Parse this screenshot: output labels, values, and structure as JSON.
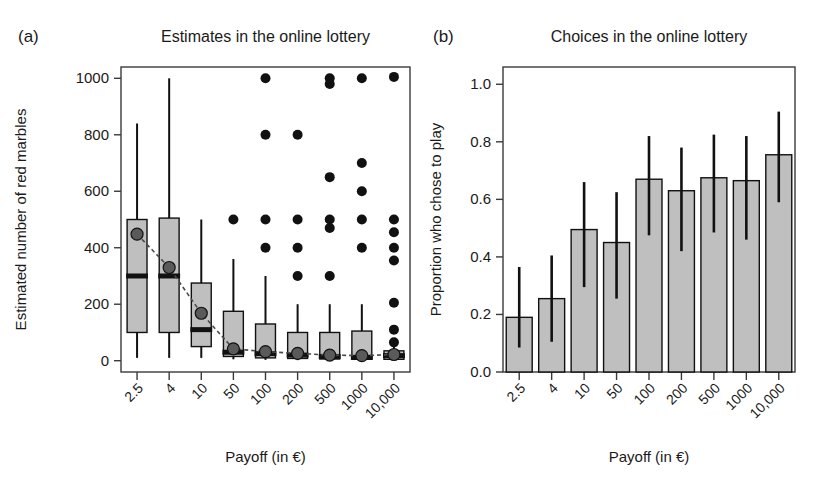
{
  "figure": {
    "width": 830,
    "height": 482,
    "background": "#ffffff",
    "ink_color": "#1a1a1a",
    "fill_gray": "#bfbfbf",
    "mean_gray": "#5a5a5a"
  },
  "panels": [
    {
      "letter": "(a)",
      "title": "Estimates in the online lottery",
      "xlabel": "Payoff (in €)",
      "ylabel": "Estimated number of red marbles"
    },
    {
      "letter": "(b)",
      "title": "Choices in the online lottery",
      "xlabel": "Payoff (in €)",
      "ylabel": "Proportion who chose to play"
    }
  ],
  "chart_data": [
    {
      "type": "box",
      "title": "Estimates in the online lottery",
      "panel": "(a)",
      "xlabel": "Payoff (in €)",
      "ylabel": "Estimated number of red marbles",
      "categories": [
        "2.5",
        "4",
        "10",
        "50",
        "100",
        "200",
        "500",
        "1000",
        "10,000"
      ],
      "yticks": [
        0,
        200,
        400,
        600,
        800,
        1000
      ],
      "ytick_labels": [
        "0",
        "200",
        "400",
        "600",
        "800",
        "1000"
      ],
      "ylim": [
        -40,
        1040
      ],
      "grid": false,
      "legend": "none",
      "boxes": [
        {
          "category": "2.5",
          "lower_whisker": 10,
          "q1": 100,
          "median": 300,
          "q3": 500,
          "upper_whisker": 840,
          "mean": 448,
          "outliers": []
        },
        {
          "category": "4",
          "lower_whisker": 10,
          "q1": 100,
          "median": 300,
          "q3": 505,
          "upper_whisker": 1000,
          "mean": 330,
          "outliers": []
        },
        {
          "category": "10",
          "lower_whisker": 10,
          "q1": 50,
          "median": 110,
          "q3": 275,
          "upper_whisker": 500,
          "mean": 168,
          "outliers": []
        },
        {
          "category": "50",
          "lower_whisker": 5,
          "q1": 15,
          "median": 30,
          "q3": 175,
          "upper_whisker": 360,
          "mean": 42,
          "outliers": [
            500
          ]
        },
        {
          "category": "100",
          "lower_whisker": 3,
          "q1": 10,
          "median": 25,
          "q3": 130,
          "upper_whisker": 300,
          "mean": 32,
          "outliers": [
            1000,
            800,
            500,
            400
          ]
        },
        {
          "category": "200",
          "lower_whisker": 2,
          "q1": 8,
          "median": 20,
          "q3": 100,
          "upper_whisker": 200,
          "mean": 26,
          "outliers": [
            800,
            500,
            400,
            300
          ]
        },
        {
          "category": "500",
          "lower_whisker": 2,
          "q1": 6,
          "median": 15,
          "q3": 100,
          "upper_whisker": 200,
          "mean": 20,
          "outliers": [
            1000,
            980,
            650,
            500,
            470,
            300
          ]
        },
        {
          "category": "1000",
          "lower_whisker": 2,
          "q1": 5,
          "median": 12,
          "q3": 105,
          "upper_whisker": 200,
          "mean": 18,
          "outliers": [
            1000,
            700,
            600,
            500,
            400
          ]
        },
        {
          "category": "10,000",
          "lower_whisker": 2,
          "q1": 5,
          "median": 18,
          "q3": 35,
          "upper_whisker": 60,
          "mean": 22,
          "outliers": [
            1005,
            500,
            455,
            400,
            355,
            205,
            110,
            65
          ]
        }
      ],
      "mean_line_connects": true
    },
    {
      "type": "bar",
      "title": "Choices in the online lottery",
      "panel": "(b)",
      "xlabel": "Payoff (in €)",
      "ylabel": "Proportion who chose to play",
      "categories": [
        "2.5",
        "4",
        "10",
        "50",
        "100",
        "200",
        "500",
        "1000",
        "10,000"
      ],
      "values": [
        0.19,
        0.255,
        0.495,
        0.45,
        0.67,
        0.63,
        0.675,
        0.665,
        0.755
      ],
      "error_low": [
        0.085,
        0.105,
        0.295,
        0.255,
        0.475,
        0.42,
        0.485,
        0.46,
        0.59
      ],
      "error_high": [
        0.365,
        0.405,
        0.66,
        0.625,
        0.82,
        0.78,
        0.825,
        0.82,
        0.905
      ],
      "yticks": [
        0.0,
        0.2,
        0.4,
        0.6,
        0.8,
        1.0
      ],
      "ytick_labels": [
        "0.0",
        "0.2",
        "0.4",
        "0.6",
        "0.8",
        "1.0"
      ],
      "ylim": [
        0.0,
        1.06
      ],
      "grid": false,
      "legend": "none"
    }
  ]
}
